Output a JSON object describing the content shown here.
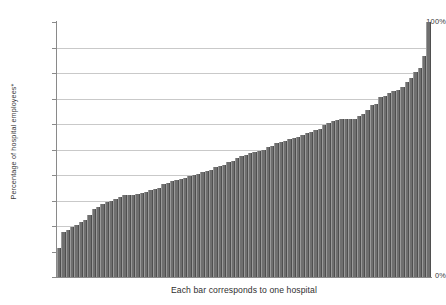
{
  "chart_data": {
    "type": "bar",
    "title": "",
    "subtitle": "",
    "xlabel": "Each bar corresponds to one hospital",
    "ylabel": "Percentage of hospital employees*",
    "ylim": [
      0,
      100
    ],
    "xlim_note": "one bar per hospital, sorted ascending",
    "grid": true,
    "gridline_values": [
      10,
      20,
      30,
      40,
      50,
      60,
      70,
      80,
      90
    ],
    "legend": null,
    "legend_position": "none",
    "y_tick_labels": [
      {
        "value": 100,
        "label": "100%"
      },
      {
        "value": 90,
        "label": ""
      },
      {
        "value": 80,
        "label": ""
      },
      {
        "value": 70,
        "label": ""
      },
      {
        "value": 60,
        "label": ""
      },
      {
        "value": 50,
        "label": ""
      },
      {
        "value": 40,
        "label": ""
      },
      {
        "value": 30,
        "label": ""
      },
      {
        "value": 20,
        "label": ""
      },
      {
        "value": 10,
        "label": ""
      },
      {
        "value": 0,
        "label": "0%"
      }
    ],
    "y_tick_top_label": "100%",
    "y_tick_bottom_label": "0%",
    "x_tick_labels": [],
    "annotations": [],
    "series_name": "Percentage of hospital employees",
    "bar_count": 86,
    "categories": [
      "1",
      "2",
      "3",
      "4",
      "5",
      "6",
      "7",
      "8",
      "9",
      "10",
      "11",
      "12",
      "13",
      "14",
      "15",
      "16",
      "17",
      "18",
      "19",
      "20",
      "21",
      "22",
      "23",
      "24",
      "25",
      "26",
      "27",
      "28",
      "29",
      "30",
      "31",
      "32",
      "33",
      "34",
      "35",
      "36",
      "37",
      "38",
      "39",
      "40",
      "41",
      "42",
      "43",
      "44",
      "45",
      "46",
      "47",
      "48",
      "49",
      "50",
      "51",
      "52",
      "53",
      "54",
      "55",
      "56",
      "57",
      "58",
      "59",
      "60",
      "61",
      "62",
      "63",
      "64",
      "65",
      "66",
      "67",
      "68",
      "69",
      "70",
      "71",
      "72",
      "73",
      "74",
      "75",
      "76",
      "77",
      "78",
      "79",
      "80",
      "81",
      "82",
      "83",
      "84",
      "85",
      "86"
    ],
    "values": [
      11.5,
      17.5,
      18.5,
      19.5,
      20.5,
      21.5,
      22.5,
      24.5,
      26.5,
      27.5,
      28.5,
      29.5,
      30.0,
      30.5,
      31.5,
      32.0,
      32.0,
      32.0,
      32.5,
      33.0,
      33.5,
      34.0,
      34.5,
      35.0,
      36.5,
      37.0,
      37.5,
      38.0,
      38.5,
      39.0,
      39.5,
      40.0,
      40.5,
      41.0,
      41.5,
      42.0,
      43.0,
      43.5,
      44.0,
      45.0,
      45.5,
      46.5,
      47.5,
      48.0,
      48.5,
      49.0,
      49.5,
      50.0,
      51.0,
      51.5,
      52.5,
      53.0,
      53.5,
      54.0,
      54.5,
      55.0,
      55.5,
      56.5,
      57.0,
      57.5,
      58.0,
      59.5,
      60.5,
      61.0,
      61.5,
      62.0,
      62.0,
      62.0,
      62.0,
      63.0,
      64.0,
      65.5,
      67.5,
      68.0,
      70.5,
      71.0,
      72.0,
      73.0,
      73.5,
      74.5,
      76.5,
      78.0,
      80.5,
      82.0,
      86.5,
      100.0
    ],
    "bar_color": "#6f6f6f",
    "gridline_color": "#c9c9c9",
    "axis_color": "#8a8a8a",
    "text_color": "#3a3a3a",
    "background_color": "#ffffff"
  }
}
